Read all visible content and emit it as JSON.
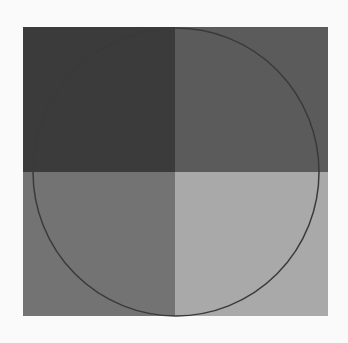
{
  "figure": {
    "quadrants": [
      {
        "position": "top-left",
        "color": "#3b3b3b"
      },
      {
        "position": "top-right",
        "color": "#5b5b5b"
      },
      {
        "position": "bottom-left",
        "color": "#737373"
      },
      {
        "position": "bottom-right",
        "color": "#a9a9a9"
      }
    ],
    "circle": {
      "stroke": "#3a3a3a",
      "stroke_width": 1.5,
      "cx": 176,
      "cy": 172,
      "rx": 143,
      "ry": 144
    },
    "background": "#fafafa"
  }
}
